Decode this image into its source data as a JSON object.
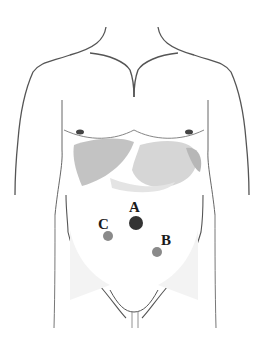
{
  "diagram": {
    "points": [
      {
        "id": "A",
        "label": "A",
        "x": 136,
        "y": 223,
        "r": 7,
        "color": "#333333",
        "label_x": 129,
        "label_y": 200
      },
      {
        "id": "B",
        "label": "B",
        "x": 157,
        "y": 252,
        "r": 5,
        "color": "#8a8a8a",
        "label_x": 161,
        "label_y": 233
      },
      {
        "id": "C",
        "label": "C",
        "x": 108,
        "y": 236,
        "r": 5,
        "color": "#8a8a8a",
        "label_x": 98,
        "label_y": 217
      }
    ],
    "colors": {
      "outline": "#555555",
      "organ_dark": "#b8b8b8",
      "organ_light": "#d6d6d6",
      "skin_shade": "#eeeeee"
    }
  }
}
